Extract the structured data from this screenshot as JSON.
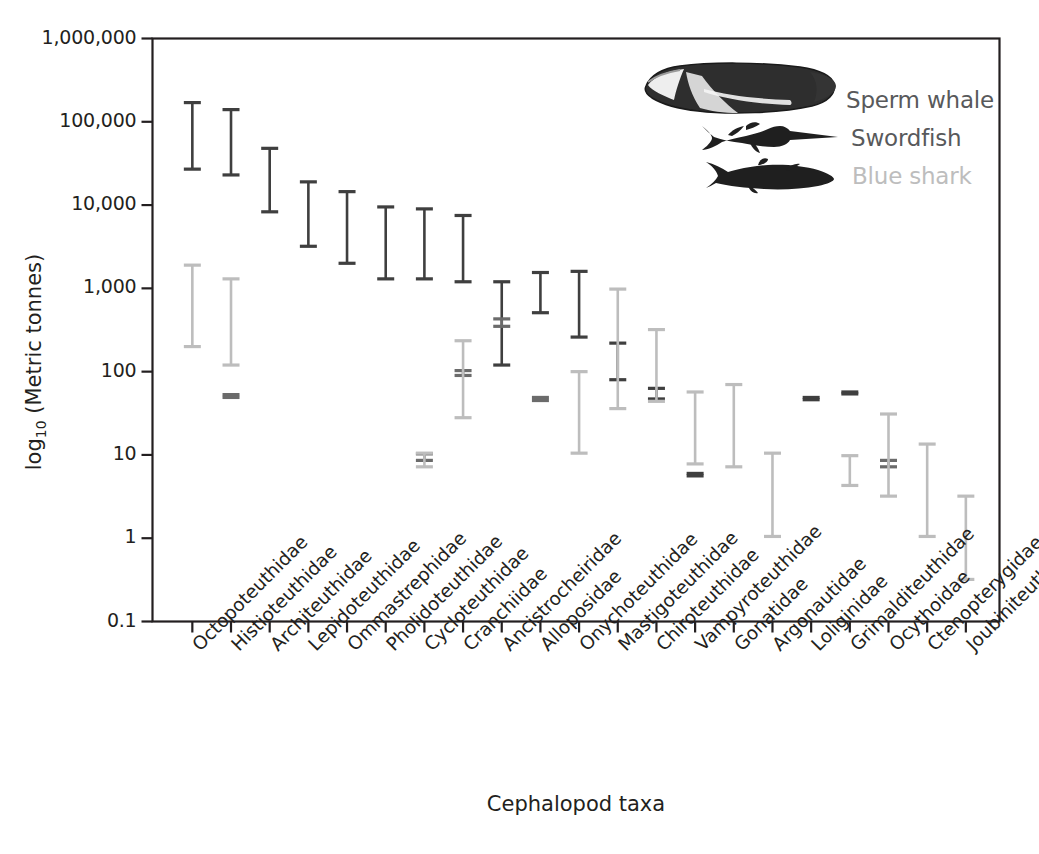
{
  "chart_data": {
    "type": "bar",
    "subtype": "range-interval-chart",
    "title": "",
    "xlabel": "Cephalopod taxa",
    "ylabel": "log10 (Metric tonnes)",
    "ylabel_parts": {
      "base": "log",
      "subscript": "10",
      "unit": "(Metric tonnes)"
    },
    "yscale": "log",
    "ylim": [
      0.1,
      1000000
    ],
    "ytick_labels": [
      "1,000,000",
      "100,000",
      "10,000",
      "1,000",
      "100",
      "10",
      "1",
      "0.1"
    ],
    "ytick_values": [
      1000000,
      100000,
      10000,
      1000,
      100,
      10,
      1,
      0.1
    ],
    "grid": false,
    "legend_position": "top-right",
    "categories": [
      "Octopoteuthidae",
      "Histioteuthidae",
      "Architeuthidae",
      "Lepidoteuthidae",
      "Ommastrephidae",
      "Pholidoteuthidae",
      "Cycloteuthidae",
      "Cranchiidae",
      "Ancistrocheiridae",
      "Alloposidae",
      "Onychoteuthidae",
      "Mastigoteuthidae",
      "Chiroteuthidae",
      "Vampyroteuthidae",
      "Gonatidae",
      "Argonautidae",
      "Loliginidae",
      "Grimalditeuthidae",
      "Ocythoidae",
      "Ctenopterygidae",
      "Joubiniteuthidae"
    ],
    "series": [
      {
        "name": "Sperm whale",
        "color": "#3f3f3f",
        "legend_icon": "sperm-whale-icon",
        "intervals": [
          [
            27000,
            170000
          ],
          [
            23000,
            140000
          ],
          [
            8300,
            48000
          ],
          [
            3200,
            19000
          ],
          [
            2000,
            14500
          ],
          [
            1300,
            9500
          ],
          [
            1300,
            9000
          ],
          [
            1200,
            7500
          ],
          [
            120,
            1200
          ],
          [
            510,
            1550
          ],
          [
            260,
            1600
          ],
          [
            80,
            220
          ],
          [
            47,
            63
          ],
          [
            5.6,
            6.0
          ],
          [
            null,
            null
          ],
          [
            null,
            null
          ],
          [
            46,
            49
          ],
          [
            54,
            57
          ],
          [
            null,
            null
          ],
          [
            null,
            null
          ],
          [
            null,
            null
          ]
        ]
      },
      {
        "name": "Swordfish",
        "color": "#6b6b6b",
        "legend_icon": "swordfish-icon",
        "intervals": [
          [
            null,
            null
          ],
          [
            49,
            53
          ],
          [
            null,
            null
          ],
          [
            null,
            null
          ],
          [
            null,
            null
          ],
          [
            null,
            null
          ],
          [
            8.6,
            10.3
          ],
          [
            90,
            103
          ],
          [
            350,
            430
          ],
          [
            45,
            49
          ],
          [
            null,
            null
          ],
          [
            null,
            null
          ],
          [
            null,
            null
          ],
          [
            null,
            null
          ],
          [
            null,
            null
          ],
          [
            null,
            null
          ],
          [
            null,
            null
          ],
          [
            null,
            null
          ],
          [
            7.2,
            8.6
          ],
          [
            null,
            null
          ],
          [
            null,
            null
          ]
        ]
      },
      {
        "name": "Blue shark",
        "color": "#bdbdbd",
        "legend_icon": "blue-shark-icon",
        "intervals": [
          [
            200,
            1900
          ],
          [
            120,
            1300
          ],
          [
            null,
            null
          ],
          [
            null,
            null
          ],
          [
            null,
            null
          ],
          [
            null,
            null
          ],
          [
            7.2,
            10.5
          ],
          [
            28,
            235
          ],
          [
            null,
            null
          ],
          [
            null,
            null
          ],
          [
            10.5,
            100
          ],
          [
            36,
            980
          ],
          [
            44,
            320
          ],
          [
            7.8,
            57
          ],
          [
            7.2,
            70
          ],
          [
            1.05,
            10.5
          ],
          [
            null,
            null
          ],
          [
            4.3,
            9.8
          ],
          [
            3.2,
            31
          ],
          [
            1.05,
            13.5
          ],
          [
            0.32,
            3.2
          ]
        ]
      }
    ]
  },
  "legend": {
    "entries": [
      {
        "label": "Sperm whale",
        "icon": "sperm-whale-icon",
        "text_color": "#58595b"
      },
      {
        "label": "Swordfish",
        "icon": "swordfish-icon",
        "text_color": "#58595b"
      },
      {
        "label": "Blue shark",
        "icon": "blue-shark-icon",
        "text_color": "#bdbdbd"
      }
    ]
  },
  "colors": {
    "sperm_whale": "#3f3f3f",
    "swordfish": "#6b6b6b",
    "blue_shark": "#bdbdbd",
    "axis": "#231f20",
    "background": "#ffffff"
  }
}
